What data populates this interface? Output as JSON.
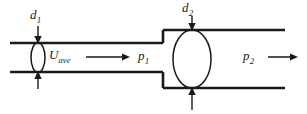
{
  "figure": {
    "background_color": "#ffffff",
    "line_color": "#1a1a1a"
  },
  "labels": {
    "d1": {
      "symbol": "d",
      "subscript": "1",
      "text": "d1"
    },
    "d2": {
      "symbol": "d",
      "subscript": "2",
      "text": "d2"
    },
    "u_ave": {
      "symbol": "U",
      "subscript": "ave",
      "text": "Uave"
    },
    "p1": {
      "symbol": "p",
      "subscript": "1",
      "text": "p1"
    },
    "p2": {
      "symbol": "p",
      "subscript": "2",
      "text": "p2"
    }
  },
  "geometry": {
    "small_pipe": {
      "top_wall_y": 43,
      "bottom_wall_y": 72,
      "x_start": 10,
      "x_end": 163
    },
    "large_pipe": {
      "top_wall_y": 30,
      "bottom_wall_y": 88,
      "x_start": 163,
      "x_end": 285
    },
    "section_1_ellipse": {
      "cx": 38,
      "cy": 57.5,
      "rx": 7,
      "ry": 15
    },
    "section_2_ellipse": {
      "cx": 192,
      "cy": 59,
      "rx": 19,
      "ry": 29
    },
    "flow_arrow_1": {
      "x_start": 86,
      "x_end": 128,
      "y": 57
    },
    "flow_arrow_2": {
      "x_start": 268,
      "x_end": 297,
      "y": 57
    }
  }
}
